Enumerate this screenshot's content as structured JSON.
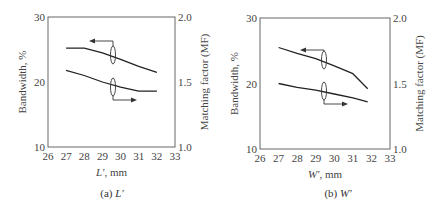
{
  "chart_data": [
    {
      "type": "line",
      "panel_caption": "(a) L′",
      "xlabel": "L′, mm",
      "ylabel": "Bandwidth, %",
      "y2label": "Matching factor (MF)",
      "xlim": [
        26,
        33
      ],
      "ylim": [
        10,
        30
      ],
      "y2lim": [
        1.0,
        2.0
      ],
      "xticks": [
        "26",
        "27",
        "28",
        "29",
        "30",
        "31",
        "32",
        "33"
      ],
      "yticks": [
        "10",
        "20",
        "30"
      ],
      "y2ticks": [
        "1.0",
        "1.5",
        "2.0"
      ],
      "grid": false,
      "series": [
        {
          "name": "Bandwidth",
          "axis": "left",
          "x": [
            27,
            28,
            29,
            30,
            31,
            32
          ],
          "values": [
            25.2,
            25.2,
            24.5,
            23.5,
            22.4,
            21.5
          ]
        },
        {
          "name": "Matching factor",
          "axis": "right",
          "x": [
            27,
            28,
            29,
            30,
            31,
            32
          ],
          "values": [
            1.59,
            1.55,
            1.5,
            1.46,
            1.43,
            1.43
          ]
        }
      ],
      "annotations": [
        "arrow pointing left to Bandwidth axis",
        "arrow pointing right to MF axis"
      ]
    },
    {
      "type": "line",
      "panel_caption": "(b) W′",
      "xlabel": "W′, mm",
      "ylabel": "Bandwidth, %",
      "y2label": "Matching factor (MF)",
      "xlim": [
        26,
        33
      ],
      "ylim": [
        10,
        30
      ],
      "y2lim": [
        1.0,
        2.0
      ],
      "xticks": [
        "26",
        "27",
        "28",
        "29",
        "30",
        "31",
        "32",
        "33"
      ],
      "yticks": [
        "10",
        "20",
        "30"
      ],
      "y2ticks": [
        "1.0",
        "1.5",
        "2.0"
      ],
      "grid": false,
      "series": [
        {
          "name": "Bandwidth",
          "axis": "left",
          "x": [
            27,
            28,
            29,
            30,
            31,
            31.8
          ],
          "values": [
            25.5,
            24.6,
            23.8,
            22.7,
            21.5,
            19.2
          ]
        },
        {
          "name": "Matching factor",
          "axis": "right",
          "x": [
            27,
            28,
            29,
            30,
            31,
            31.8
          ],
          "values": [
            1.5,
            1.47,
            1.45,
            1.42,
            1.39,
            1.36
          ]
        }
      ],
      "annotations": [
        "arrow pointing left to Bandwidth axis",
        "arrow pointing right to MF axis"
      ]
    }
  ],
  "panels": [
    {
      "caption_prefix": "(a) ",
      "caption_var": "L′",
      "xlabel": "L′, mm"
    },
    {
      "caption_prefix": "(b) ",
      "caption_var": "W′",
      "xlabel": "W′, mm"
    }
  ]
}
